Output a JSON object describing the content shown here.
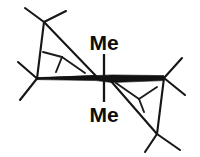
{
  "figure": {
    "kind": "chemical-structure-diagram",
    "background_color": "#ffffff",
    "line_color": "#161616",
    "width": 200,
    "height": 157
  },
  "labels": {
    "top_methyl": "Me",
    "bottom_methyl": "Me"
  },
  "geometry": {
    "central_bond": {
      "name": "metal-metal-bold-bond",
      "x1": 37.0,
      "y1": 78.5,
      "x2": 164.0,
      "y2": 78.0,
      "max_thickness": 7.5
    },
    "left_center_atom": {
      "x": 37.0,
      "y": 78.5
    },
    "right_center_atom": {
      "x": 164.0,
      "y": 78.0
    },
    "methyl_stub_top": {
      "x1": 104.0,
      "y1": 55.0,
      "x2": 104.0,
      "y2": 78.0
    },
    "methyl_stub_bottom": {
      "x1": 104.0,
      "y1": 79.0,
      "x2": 104.0,
      "y2": 101.0
    },
    "top_label_pos": {
      "x": 104,
      "y": 50
    },
    "bottom_label_pos": {
      "x": 104,
      "y": 122
    },
    "left_ring": [
      {
        "x": 37.0,
        "y": 78.5
      },
      {
        "x": 44.0,
        "y": 22.0
      },
      {
        "x": 96.0,
        "y": 76.0
      }
    ],
    "right_ring": [
      {
        "x": 164.0,
        "y": 78.0
      },
      {
        "x": 157.0,
        "y": 134.0
      },
      {
        "x": 110.0,
        "y": 80.0
      }
    ],
    "left_inner_vertex": {
      "x": 62.0,
      "y": 57.0
    },
    "right_inner_vertex": {
      "x": 139.0,
      "y": 99.0
    },
    "tbutyl_upper_left": {
      "quaternary": {
        "x": 44.0,
        "y": 22.0
      },
      "arms": [
        {
          "x": 25.0,
          "y": 8.0
        },
        {
          "x": 66.0,
          "y": 11.0
        },
        {
          "x": 48.0,
          "y": 44.0
        }
      ]
    },
    "tbutyl_left_lower": {
      "quaternary": {
        "x": 37.0,
        "y": 78.5
      },
      "arms": [
        {
          "x": 18.0,
          "y": 62.0
        },
        {
          "x": 20.0,
          "y": 100.0
        }
      ]
    },
    "tbutyl_lower_right": {
      "quaternary": {
        "x": 157.0,
        "y": 134.0
      },
      "arms": [
        {
          "x": 145.0,
          "y": 152.0
        },
        {
          "x": 180.0,
          "y": 150.0
        },
        {
          "x": 152.0,
          "y": 112.0
        }
      ]
    },
    "tbutyl_right_upper": {
      "quaternary": {
        "x": 164.0,
        "y": 78.0
      },
      "arms": [
        {
          "x": 182.0,
          "y": 58.0
        },
        {
          "x": 185.0,
          "y": 95.0
        }
      ]
    },
    "left_inner_arms": [
      {
        "x": 43.0,
        "y": 52.0
      },
      {
        "x": 56.0,
        "y": 72.0
      }
    ],
    "right_inner_arms": [
      {
        "x": 157.0,
        "y": 87.0
      },
      {
        "x": 144.0,
        "y": 112.0
      }
    ]
  }
}
